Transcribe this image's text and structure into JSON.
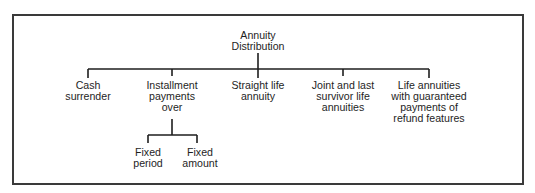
{
  "diagram": {
    "type": "tree",
    "root": {
      "id": "root",
      "lines": [
        "Annuity",
        "Distribution"
      ]
    },
    "children": [
      {
        "id": "cash",
        "lines": [
          "Cash",
          "surrender"
        ]
      },
      {
        "id": "installment",
        "lines": [
          "Installment",
          "payments",
          "over"
        ],
        "children": [
          {
            "id": "fixed-period",
            "lines": [
              "Fixed",
              "period"
            ]
          },
          {
            "id": "fixed-amount",
            "lines": [
              "Fixed",
              "amount"
            ]
          }
        ]
      },
      {
        "id": "straight-life",
        "lines": [
          "Straight life",
          "annuity"
        ]
      },
      {
        "id": "joint-last",
        "lines": [
          "Joint and last",
          "survivor life",
          "annuities"
        ]
      },
      {
        "id": "life-guaranteed",
        "lines": [
          "Life annuities",
          "with guaranteed",
          "payments of",
          "refund features"
        ]
      }
    ],
    "colors": {
      "line": "#1e1e1e",
      "border": "#3a3a3a",
      "text": "#1e1e1e",
      "background": "#ffffff"
    }
  }
}
